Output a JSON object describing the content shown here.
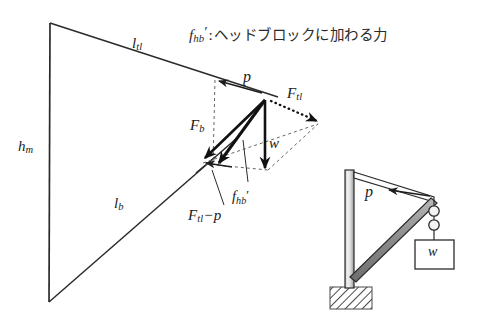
{
  "figure": {
    "caption": {
      "symbol": "f",
      "symbol_sub": "hb",
      "symbol_prime": "′",
      "separator": ":",
      "text": "ヘッドブロックに加わる力",
      "full": "f_hb′：ヘッドブロックに加わる力"
    },
    "colors": {
      "line": "#2b2b2b",
      "bold_vector": "#111111",
      "construction": "#555555",
      "text": "#1a1a1a",
      "boom_fill": "#8a8a8a",
      "mast_fill": "#d8d8d8",
      "hatch": "#4a4a4a",
      "background": "#ffffff"
    },
    "geometry_triangle": {
      "apex_top": [
        50,
        23
      ],
      "apex_bottom": [
        49,
        302
      ],
      "vertex_right": [
        265,
        100
      ],
      "description": "crane force triangle: vertical mast h_m, top tie l_tl, boom l_b"
    },
    "labels": {
      "l_tl": {
        "base": "l",
        "sub": "tl"
      },
      "h_m": {
        "base": "h",
        "sub": "m"
      },
      "l_b": {
        "base": "l",
        "sub": "b"
      },
      "p": {
        "base": "p",
        "sub": ""
      },
      "F_tl": {
        "base": "F",
        "sub": "tl"
      },
      "F_b": {
        "base": "F",
        "sub": "b"
      },
      "w": {
        "base": "w",
        "sub": ""
      },
      "f_hb_prime": {
        "base": "f",
        "sub": "hb",
        "prime": "′"
      },
      "F_tl_minus_p": {
        "base": "F",
        "sub": "tl",
        "op": "−",
        "operand": "p"
      }
    },
    "crane": {
      "label_p": "p",
      "label_w": "w",
      "parts": [
        "mast",
        "top-tie",
        "boom",
        "pulley-block",
        "load-box",
        "foundation"
      ]
    },
    "vectors": [
      {
        "name": "p",
        "from": [
          265,
          100
        ],
        "to": [
          218,
          81
        ],
        "style": "solid-thin",
        "label": "p"
      },
      {
        "name": "F_tl",
        "from": [
          265,
          100
        ],
        "to": [
          318,
          122
        ],
        "style": "dotted-bold",
        "label": "F_tl"
      },
      {
        "name": "F_b",
        "from": [
          265,
          100
        ],
        "to": [
          203,
          160
        ],
        "style": "solid-bold",
        "label": "F_b"
      },
      {
        "name": "w",
        "from": [
          265,
          100
        ],
        "to": [
          265,
          172
        ],
        "style": "solid-bold",
        "label": "w"
      },
      {
        "name": "f_hb'",
        "from": [
          265,
          100
        ],
        "to": [
          216,
          166
        ],
        "style": "solid-bold",
        "label": "f_hb′"
      },
      {
        "name": "F_tl-p",
        "from": [
          230,
          166
        ],
        "to": [
          203,
          163
        ],
        "style": "solid-thin",
        "label": "F_tl−p"
      }
    ]
  }
}
